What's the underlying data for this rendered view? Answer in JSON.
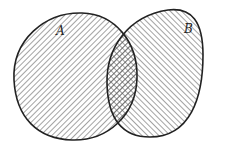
{
  "diagram": {
    "type": "venn",
    "sets": [
      {
        "id": "A",
        "label": "A",
        "hatch": "diagonal-forward"
      },
      {
        "id": "B",
        "label": "B",
        "hatch": "diagonal-backward"
      }
    ],
    "intersection": {
      "hatch": "crosshatch"
    },
    "colors": {
      "stroke": "#222222",
      "hatch": "#555555",
      "background": "#ffffff"
    }
  }
}
